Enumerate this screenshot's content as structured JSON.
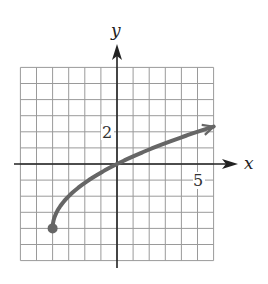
{
  "chart_data": {
    "type": "line",
    "title": "",
    "xlabel": "x",
    "ylabel": "y",
    "xlim": [
      -6,
      6
    ],
    "ylim": [
      -6,
      6
    ],
    "grid": true,
    "grid_step": 1,
    "tick_labels": [
      {
        "axis": "x",
        "value": 5,
        "label": "5"
      },
      {
        "axis": "y",
        "value": 2,
        "label": "2"
      }
    ],
    "series": [
      {
        "name": "curve",
        "function": "y = 2*sqrt(x+4) - 4",
        "start_point": {
          "x": -4,
          "y": -4,
          "closed": true
        },
        "end": {
          "x": 6,
          "y": 2.32,
          "arrow": true
        },
        "x": [
          -4,
          -3,
          -2,
          -1,
          0,
          1,
          2,
          3,
          4,
          5,
          6
        ],
        "values": [
          -4,
          -2,
          -1.17,
          -0.53,
          0,
          0.47,
          0.9,
          1.29,
          1.66,
          2.0,
          2.32
        ],
        "color": "#666666"
      }
    ]
  },
  "labels": {
    "x_axis": "x",
    "y_axis": "y",
    "x_tick": "5",
    "y_tick": "2"
  }
}
